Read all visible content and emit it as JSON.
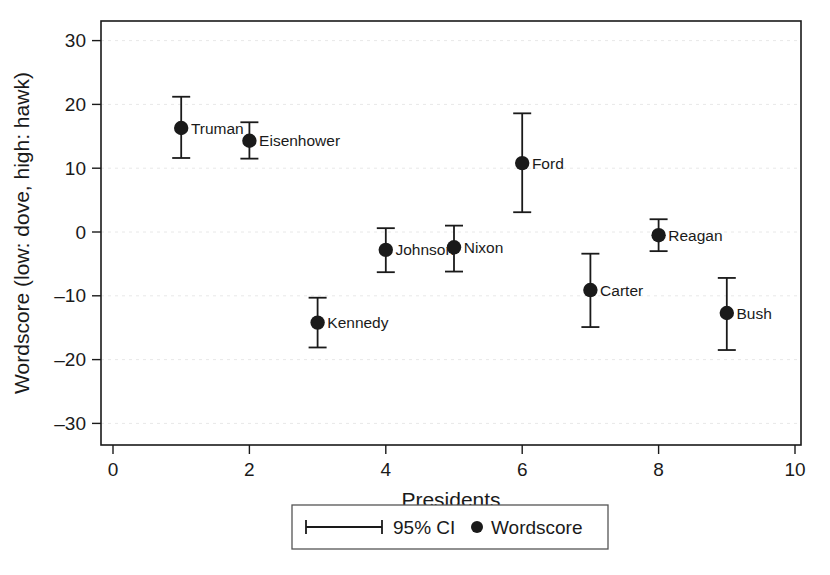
{
  "chart_data": {
    "type": "scatter",
    "title": "",
    "xlabel": "Presidents",
    "ylabel": "Wordscore (low: dove, high: hawk)",
    "xlim": [
      0,
      10
    ],
    "ylim": [
      -33,
      33
    ],
    "xticks": [
      0,
      2,
      4,
      6,
      8,
      10
    ],
    "yticks": [
      30,
      20,
      10,
      0,
      -10,
      -20,
      -30
    ],
    "ytick_labels": [
      "30",
      "20",
      "10",
      "0",
      "–10",
      "–20",
      "–30"
    ],
    "xtick_labels": [
      "0",
      "2",
      "4",
      "6",
      "8",
      "10"
    ],
    "grid": true,
    "grid_axis": "y",
    "legend_position": "below-axes",
    "error_type": "95% CI",
    "points": [
      {
        "label": "Truman",
        "x": 1,
        "y": 16.3,
        "ci_low": 11.6,
        "ci_high": 21.2,
        "label_side": "right"
      },
      {
        "label": "Eisenhower",
        "x": 2,
        "y": 14.3,
        "ci_low": 11.5,
        "ci_high": 17.2,
        "label_side": "right"
      },
      {
        "label": "Kennedy",
        "x": 3,
        "y": -14.2,
        "ci_low": -18.1,
        "ci_high": -10.3,
        "label_side": "right"
      },
      {
        "label": "Johnson",
        "x": 4,
        "y": -2.8,
        "ci_low": -6.3,
        "ci_high": 0.6,
        "label_side": "right"
      },
      {
        "label": "Nixon",
        "x": 5,
        "y": -2.4,
        "ci_low": -6.2,
        "ci_high": 1.0,
        "label_side": "right"
      },
      {
        "label": "Ford",
        "x": 6,
        "y": 10.8,
        "ci_low": 3.1,
        "ci_high": 18.6,
        "label_side": "right"
      },
      {
        "label": "Carter",
        "x": 7,
        "y": -9.1,
        "ci_low": -14.9,
        "ci_high": -3.4,
        "label_side": "right"
      },
      {
        "label": "Reagan",
        "x": 8,
        "y": -0.5,
        "ci_low": -3.0,
        "ci_high": 2.0,
        "label_side": "right"
      },
      {
        "label": "Bush",
        "x": 9,
        "y": -12.7,
        "ci_low": -18.5,
        "ci_high": -7.2,
        "label_side": "right"
      }
    ],
    "legend": [
      {
        "key": "ci-entry",
        "label": "95% CI",
        "symbol": "errorbar"
      },
      {
        "key": "wordscore-entry",
        "label": "Wordscore",
        "symbol": "dot"
      }
    ],
    "colors": {
      "marker": "#1a1a1a",
      "errorbar": "#1a1a1a",
      "axis": "#1a1a1a",
      "grid": "#e8e8e8",
      "legend_border": "#555555",
      "background": "#ffffff"
    }
  }
}
